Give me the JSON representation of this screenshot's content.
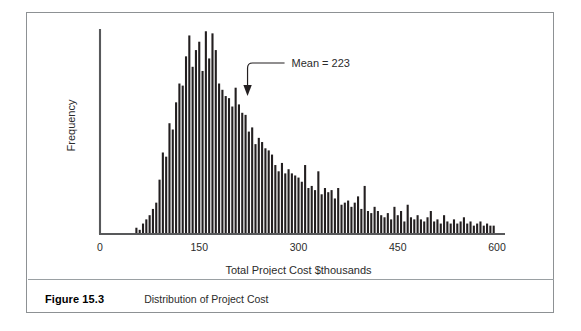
{
  "figure": {
    "caption_label": "Figure 15.3",
    "caption_text": "Distribution of Project Cost"
  },
  "chart_data": {
    "type": "bar",
    "title": "",
    "subtitle": "",
    "xlabel": "Total Project Cost $thousands",
    "ylabel": "Frequency",
    "xlim": [
      0,
      600
    ],
    "ylim": [
      0,
      100
    ],
    "grid": false,
    "legend": null,
    "bar_color": "#231f20",
    "axis_color": "#58595b",
    "xtick_labels": [
      "0",
      "150",
      "300",
      "450",
      "600"
    ],
    "xtick_values": [
      0,
      150,
      300,
      450,
      600
    ],
    "ytick_labels": [],
    "bin_width": 5,
    "annotations": [
      {
        "name": "mean-marker",
        "label": "Mean = 223",
        "value": 223,
        "arrow": true
      }
    ],
    "x": [
      55,
      60,
      65,
      70,
      75,
      80,
      85,
      90,
      95,
      100,
      105,
      110,
      115,
      120,
      125,
      130,
      135,
      140,
      145,
      150,
      155,
      160,
      165,
      170,
      175,
      180,
      185,
      190,
      195,
      200,
      205,
      210,
      215,
      220,
      225,
      230,
      235,
      240,
      245,
      250,
      255,
      260,
      265,
      270,
      275,
      280,
      285,
      290,
      295,
      300,
      305,
      310,
      315,
      320,
      325,
      330,
      335,
      340,
      345,
      350,
      355,
      360,
      365,
      370,
      375,
      380,
      385,
      390,
      395,
      400,
      405,
      410,
      415,
      420,
      425,
      430,
      435,
      440,
      445,
      450,
      455,
      460,
      465,
      470,
      475,
      480,
      485,
      490,
      495,
      500,
      505,
      510,
      515,
      520,
      525,
      530,
      535,
      540,
      545,
      550,
      555,
      560,
      565,
      570,
      575,
      580,
      585,
      590,
      595
    ],
    "values": [
      3,
      2,
      5,
      7,
      9,
      12,
      15,
      26,
      39,
      37,
      53,
      50,
      63,
      72,
      71,
      85,
      95,
      80,
      88,
      92,
      78,
      97,
      84,
      96,
      88,
      72,
      69,
      66,
      65,
      61,
      70,
      62,
      58,
      57,
      49,
      51,
      43,
      46,
      44,
      41,
      40,
      38,
      33,
      30,
      34,
      29,
      31,
      29,
      28,
      27,
      25,
      33,
      22,
      23,
      21,
      30,
      19,
      22,
      20,
      21,
      17,
      22,
      14,
      15,
      16,
      13,
      15,
      18,
      12,
      23,
      11,
      10,
      13,
      11,
      9,
      8,
      10,
      7,
      13,
      9,
      11,
      6,
      14,
      8,
      7,
      9,
      7,
      6,
      8,
      11,
      6,
      7,
      5,
      9,
      6,
      5,
      7,
      5,
      6,
      8,
      5,
      6,
      4,
      5,
      6,
      4,
      5,
      4,
      4
    ]
  }
}
